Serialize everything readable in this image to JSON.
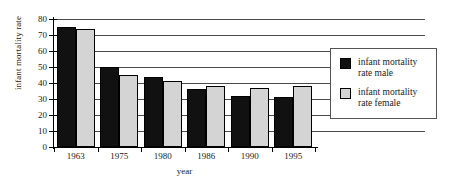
{
  "chart_data": {
    "type": "bar",
    "title": "",
    "xlabel": "year",
    "ylabel": "infant mortality rate",
    "categories": [
      "1963",
      "1975",
      "1980",
      "1986",
      "1990",
      "1995"
    ],
    "series": [
      {
        "name": "infant mortality rate male",
        "color": "#111111",
        "values": [
          75,
          50,
          44,
          36,
          32,
          31
        ]
      },
      {
        "name": "infant mortality rate female",
        "color": "#d4d4d4",
        "values": [
          74,
          45,
          41,
          38,
          37,
          38
        ]
      }
    ],
    "ylim": [
      0,
      80
    ],
    "ytick_step": 10,
    "yticks": [
      "80",
      "70",
      "60",
      "50",
      "40",
      "30",
      "20",
      "10",
      "0"
    ],
    "grid": "horizontal",
    "legend_position": "right"
  },
  "legend": {
    "items": [
      {
        "label_line1": "infant mortality",
        "label_line2": "rate male",
        "swatch": "black-square-swatch"
      },
      {
        "label_line1": "infant mortality",
        "label_line2": "rate female",
        "swatch": "gray-square-swatch"
      }
    ]
  }
}
